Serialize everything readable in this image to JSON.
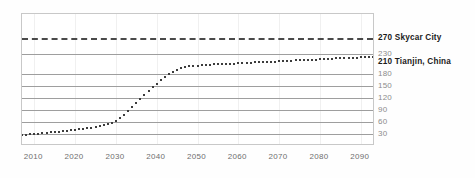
{
  "chart_data": {
    "type": "line",
    "title": "",
    "subtitle": "",
    "xlabel": "",
    "ylabel": "",
    "xlim": [
      2007,
      2093
    ],
    "ylim": [
      0,
      330
    ],
    "grid": true,
    "legend_position": "right",
    "x_tick_labels": [
      "2010",
      "2020",
      "2030",
      "2040",
      "2050",
      "2060",
      "2070",
      "2080",
      "2090"
    ],
    "x_ticks": [
      2010,
      2020,
      2030,
      2040,
      2050,
      2060,
      2070,
      2080,
      2090
    ],
    "y_tick_labels": [
      "30",
      "60",
      "90",
      "120",
      "150",
      "180",
      "230",
      "270"
    ],
    "y_ticks": [
      30,
      60,
      90,
      120,
      150,
      180,
      230,
      270
    ],
    "annotations": [
      {
        "name": "skycar-city",
        "value": 270,
        "label": "270 Skycar City",
        "style": "dashed",
        "bold": true
      },
      {
        "name": "tianjin-china",
        "value": 210,
        "label": "210 Tianjin, China",
        "style": "series-end",
        "bold": true
      }
    ],
    "series": [
      {
        "name": "growth-curve",
        "style": "dotted",
        "x": [
          2007,
          2008,
          2009,
          2010,
          2011,
          2012,
          2013,
          2014,
          2015,
          2016,
          2017,
          2018,
          2019,
          2020,
          2021,
          2022,
          2023,
          2024,
          2025,
          2026,
          2027,
          2028,
          2029,
          2030,
          2031,
          2032,
          2033,
          2034,
          2035,
          2036,
          2037,
          2038,
          2039,
          2040,
          2041,
          2042,
          2043,
          2044,
          2045,
          2046,
          2047,
          2048,
          2049,
          2050,
          2051,
          2052,
          2053,
          2054,
          2055,
          2056,
          2057,
          2058,
          2059,
          2060,
          2061,
          2062,
          2063,
          2064,
          2065,
          2066,
          2067,
          2068,
          2069,
          2070,
          2071,
          2072,
          2073,
          2074,
          2075,
          2076,
          2077,
          2078,
          2079,
          2080,
          2081,
          2082,
          2083,
          2084,
          2085,
          2086,
          2087,
          2088,
          2089,
          2090,
          2091,
          2092,
          2093
        ],
        "values": [
          27,
          28,
          29,
          30,
          31,
          32,
          33,
          34,
          35,
          36,
          37,
          38,
          39,
          40,
          42,
          43,
          45,
          46,
          48,
          50,
          52,
          55,
          58,
          63,
          70,
          78,
          87,
          97,
          107,
          117,
          127,
          137,
          147,
          156,
          164,
          172,
          179,
          185,
          190,
          194,
          197,
          199,
          200,
          201,
          202,
          203,
          203,
          204,
          204,
          205,
          205,
          206,
          206,
          207,
          207,
          208,
          208,
          209,
          209,
          210,
          210,
          211,
          211,
          212,
          212,
          213,
          213,
          214,
          214,
          215,
          215,
          216,
          216,
          217,
          217,
          218,
          218,
          219,
          219,
          220,
          220,
          221,
          221,
          222,
          222,
          223,
          223
        ]
      }
    ]
  },
  "labels": {
    "y_axis_right": [
      {
        "text": "270 Skycar City",
        "value": 270,
        "bold": true
      },
      {
        "text": "230",
        "value": 230,
        "bold": false
      },
      {
        "text": "210 Tianjin, China",
        "value": 210,
        "bold": true
      },
      {
        "text": "180",
        "value": 180,
        "bold": false
      },
      {
        "text": "150",
        "value": 150,
        "bold": false
      },
      {
        "text": "120",
        "value": 120,
        "bold": false
      },
      {
        "text": "90",
        "value": 90,
        "bold": false
      },
      {
        "text": "60",
        "value": 60,
        "bold": false
      },
      {
        "text": "30",
        "value": 30,
        "bold": false
      }
    ],
    "x_axis": [
      "2010",
      "2020",
      "2030",
      "2040",
      "2050",
      "2060",
      "2070",
      "2080",
      "2090"
    ]
  },
  "colors": {
    "series": "#3c3c3c",
    "threshold": "#4a4a4a",
    "gridline": "#9e9e9e",
    "frame": "#c8c8c8",
    "label_muted": "#8c8c8c",
    "label_bold": "#1a1a1a",
    "background": "#fefefe"
  }
}
